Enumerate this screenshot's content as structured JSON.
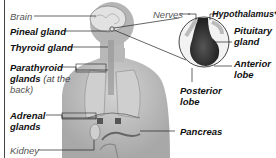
{
  "diagram": {
    "labels_left": [
      {
        "id": "brain",
        "text": "Brain",
        "style": "light"
      },
      {
        "id": "pineal",
        "text": "Pineal gland",
        "style": "bold"
      },
      {
        "id": "thyroid",
        "text": "Thyroid gland",
        "style": "bold"
      },
      {
        "id": "parathyroid",
        "text": "Parathyroid",
        "text2": "glands",
        "note": "(at the",
        "note2": "back)",
        "style": "bold"
      },
      {
        "id": "adrenal",
        "text": "Adrenal",
        "text2": "glands",
        "style": "bold"
      },
      {
        "id": "kidney",
        "text": "Kidney",
        "style": "light"
      }
    ],
    "labels_right": [
      {
        "id": "nerves",
        "text": "Nerves",
        "style": "light"
      },
      {
        "id": "hypothalamus",
        "text": "Hypothalamus*",
        "style": "bold"
      },
      {
        "id": "pituitary",
        "text": "Pituitary",
        "text2": "gland",
        "style": "bold"
      },
      {
        "id": "anterior",
        "text": "Anterior",
        "text2": "lobe",
        "style": "bold"
      },
      {
        "id": "posterior",
        "text": "Posterior",
        "text2": "lobe",
        "style": "bold"
      },
      {
        "id": "pancreas",
        "text": "Pancreas",
        "style": "bold"
      }
    ],
    "colors": {
      "body": "#bdbdbd",
      "body_shadow": "#8e8e8e",
      "organ_outline": "#7a7a7a",
      "pituitary_dark": "#3a3a3a",
      "leader_line": "#222222"
    }
  }
}
